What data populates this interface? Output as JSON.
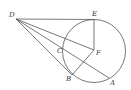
{
  "diagram": {
    "type": "geometry",
    "colors": {
      "stroke": "#555555",
      "label": "#333333",
      "background": "#ffffff"
    },
    "circle": {
      "center": "F",
      "cx": 94,
      "cy": 51,
      "r": 31.5
    },
    "points": [
      {
        "name": "D",
        "label": "D",
        "x": 16,
        "y": 19,
        "lx": 9,
        "ly": 17
      },
      {
        "name": "E",
        "label": "E",
        "x": 94,
        "y": 19.5,
        "lx": 92,
        "ly": 16
      },
      {
        "name": "F",
        "label": "F",
        "x": 94,
        "y": 50,
        "lx": 96,
        "ly": 55
      },
      {
        "name": "C",
        "label": "C",
        "x": 64,
        "y": 45,
        "lx": 57,
        "ly": 53
      },
      {
        "name": "B",
        "label": "B",
        "x": 72,
        "y": 75,
        "lx": 66,
        "ly": 81
      },
      {
        "name": "A",
        "label": "A",
        "x": 109,
        "y": 78,
        "lx": 110,
        "ly": 85
      }
    ],
    "segments": [
      {
        "from": "D",
        "to": "E"
      },
      {
        "from": "D",
        "to": "F"
      },
      {
        "from": "D",
        "to": "A"
      },
      {
        "from": "D",
        "to": "B"
      },
      {
        "from": "E",
        "to": "F"
      },
      {
        "from": "F",
        "to": "B"
      }
    ]
  }
}
